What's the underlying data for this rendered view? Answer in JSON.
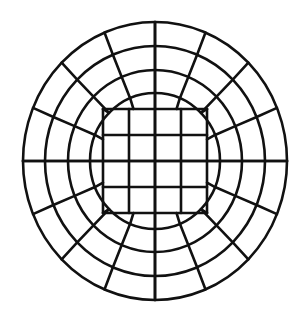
{
  "figure": {
    "type": "diagram",
    "background_color": "#ffffff",
    "line_color": "#111111",
    "line_width": 2.6,
    "core_line_width": 2.6,
    "center": {
      "x": 155,
      "y": 161
    },
    "core": {
      "name": "square-core-grid",
      "columns": 4,
      "rows": 4,
      "half_width": 52,
      "half_height": 52,
      "left": 103,
      "right": 207,
      "top": 109,
      "bottom": 213,
      "x_gridlines": [
        103,
        129,
        155,
        181,
        207
      ],
      "y_gridlines": [
        109,
        135,
        161,
        187,
        213
      ]
    },
    "rings": [
      {
        "name": "ring-1",
        "rx": 65,
        "ry": 68,
        "label": "inner ring"
      },
      {
        "name": "ring-2",
        "rx": 87,
        "ry": 91,
        "label": "second ring"
      },
      {
        "name": "ring-3",
        "rx": 110,
        "ry": 115,
        "label": "third ring"
      },
      {
        "name": "ring-4",
        "rx": 132,
        "ry": 139,
        "label": "outer boundary"
      }
    ],
    "radial_sectors": 16,
    "radial_angles_deg": [
      0,
      22.5,
      45,
      67.5,
      90,
      112.5,
      135,
      157.5,
      180,
      202.5,
      225,
      247.5,
      270,
      292.5,
      315,
      337.5
    ],
    "counts": {
      "rings": 4,
      "radial_lines": 16,
      "core_cells": 16,
      "ring_cells_per_layer": 16,
      "total_cells": 80
    }
  }
}
